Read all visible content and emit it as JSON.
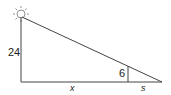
{
  "diagram": {
    "type": "similar-triangles",
    "labels": {
      "height": "24",
      "small_height": "6",
      "base_x": "x",
      "base_s": "s"
    },
    "light_source_icon": "sun-icon",
    "colors": {
      "line": "#444444",
      "text": "#222222",
      "sun": "#777777"
    }
  }
}
